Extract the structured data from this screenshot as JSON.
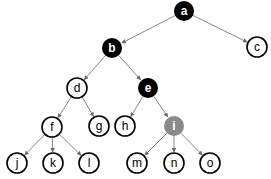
{
  "diagram": {
    "type": "tree",
    "colors": {
      "black": "#000000",
      "gray": "#8a8a8a",
      "white": "#ffffff",
      "edge": "#7a7a7a"
    },
    "nodes": [
      {
        "id": "a",
        "label": "a",
        "x": 184,
        "y": 11,
        "fill": "black"
      },
      {
        "id": "b",
        "label": "b",
        "x": 112,
        "y": 48,
        "fill": "black"
      },
      {
        "id": "c",
        "label": "c",
        "x": 257,
        "y": 47,
        "fill": "white"
      },
      {
        "id": "d",
        "label": "d",
        "x": 77,
        "y": 88,
        "fill": "white"
      },
      {
        "id": "e",
        "label": "e",
        "x": 148,
        "y": 88,
        "fill": "black"
      },
      {
        "id": "f",
        "label": "f",
        "x": 52,
        "y": 127,
        "fill": "white"
      },
      {
        "id": "g",
        "label": "g",
        "x": 99,
        "y": 126,
        "fill": "white"
      },
      {
        "id": "h",
        "label": "h",
        "x": 125,
        "y": 126,
        "fill": "white"
      },
      {
        "id": "i",
        "label": "i",
        "x": 174,
        "y": 126,
        "fill": "gray"
      },
      {
        "id": "j",
        "label": "j",
        "x": 17,
        "y": 163,
        "fill": "white"
      },
      {
        "id": "k",
        "label": "k",
        "x": 53,
        "y": 163,
        "fill": "white"
      },
      {
        "id": "l",
        "label": "l",
        "x": 89,
        "y": 163,
        "fill": "white"
      },
      {
        "id": "m",
        "label": "m",
        "x": 137,
        "y": 163,
        "fill": "white"
      },
      {
        "id": "n",
        "label": "n",
        "x": 174,
        "y": 163,
        "fill": "white"
      },
      {
        "id": "o",
        "label": "o",
        "x": 210,
        "y": 163,
        "fill": "white"
      }
    ],
    "edges": [
      [
        "a",
        "b"
      ],
      [
        "a",
        "c"
      ],
      [
        "b",
        "d"
      ],
      [
        "b",
        "e"
      ],
      [
        "d",
        "f"
      ],
      [
        "d",
        "g"
      ],
      [
        "e",
        "h"
      ],
      [
        "e",
        "i"
      ],
      [
        "f",
        "j"
      ],
      [
        "f",
        "k"
      ],
      [
        "f",
        "l"
      ],
      [
        "i",
        "m"
      ],
      [
        "i",
        "n"
      ],
      [
        "i",
        "o"
      ]
    ]
  }
}
